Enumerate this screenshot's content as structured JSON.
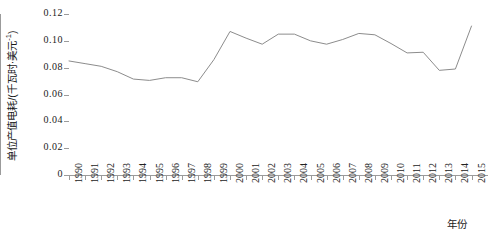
{
  "chart_data": {
    "type": "line",
    "title": "",
    "subtitle": "",
    "xlabel": "年份",
    "ylabel": "单位产值电耗/(千瓦时·美元⁻¹)",
    "ylabel_main": "单位产值电耗/(千瓦时·美元",
    "ylabel_sup": "-1",
    "ylabel_tail": ")",
    "grid": false,
    "legend": null,
    "ylim": [
      0,
      0.12
    ],
    "ytick_labels": [
      "0.12",
      "0.10",
      "0.08",
      "0.06",
      "0.04",
      "0.02",
      "0"
    ],
    "ytick_values": [
      0.12,
      0.1,
      0.08,
      0.06,
      0.04,
      0.02,
      0
    ],
    "xlim": [
      1990,
      2015
    ],
    "categories": [
      "1990",
      "1991",
      "1992",
      "1993",
      "1994",
      "1995",
      "1996",
      "1997",
      "1998",
      "1999",
      "2000",
      "2001",
      "2002",
      "2003",
      "2004",
      "2005",
      "2006",
      "2007",
      "2008",
      "2009",
      "2010",
      "2011",
      "2012",
      "2013",
      "2014",
      "2015"
    ],
    "values": [
      0.085,
      0.083,
      0.081,
      0.077,
      0.071,
      0.071,
      0.073,
      0.073,
      0.07,
      0.107,
      0.103,
      0.097,
      0.105,
      0.105,
      0.1,
      0.098,
      0.101,
      0.105,
      0.104,
      0.098,
      0.091,
      0.092,
      0.078,
      0.079,
      0.095,
      0.105
    ],
    "series": [
      {
        "name": "单位产值电耗",
        "color": "#8c8c8c",
        "line_width": 1,
        "markers": false,
        "points": [
          {
            "x": "1990",
            "y": 0.085
          },
          {
            "x": "1991",
            "y": 0.083
          },
          {
            "x": "1992",
            "y": 0.081
          },
          {
            "x": "1993",
            "y": 0.077
          },
          {
            "x": "1994",
            "y": 0.0715
          },
          {
            "x": "1995",
            "y": 0.0705
          },
          {
            "x": "1996",
            "y": 0.0725
          },
          {
            "x": "1997",
            "y": 0.0725
          },
          {
            "x": "1998",
            "y": 0.0695
          },
          {
            "x": "1999",
            "y": 0.086
          },
          {
            "x": "2000",
            "y": 0.107
          },
          {
            "x": "2001",
            "y": 0.102
          },
          {
            "x": "2002",
            "y": 0.0975
          },
          {
            "x": "2003",
            "y": 0.105
          },
          {
            "x": "2004",
            "y": 0.105
          },
          {
            "x": "2005",
            "y": 0.1
          },
          {
            "x": "2006",
            "y": 0.0975
          },
          {
            "x": "2007",
            "y": 0.101
          },
          {
            "x": "2008",
            "y": 0.1055
          },
          {
            "x": "2009",
            "y": 0.1045
          },
          {
            "x": "2010",
            "y": 0.098
          },
          {
            "x": "2011",
            "y": 0.091
          },
          {
            "x": "2012",
            "y": 0.0915
          },
          {
            "x": "2013",
            "y": 0.078
          },
          {
            "x": "2014",
            "y": 0.079
          },
          {
            "x": "2015",
            "y": 0.111
          }
        ]
      }
    ],
    "axis_color": "#9b9b9b",
    "text_color": "#222222"
  }
}
